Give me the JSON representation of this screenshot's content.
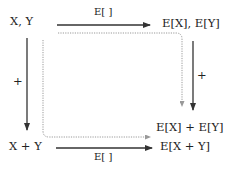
{
  "nodes": {
    "top_left": "X, Y",
    "top_right": "E[X], E[Y]",
    "mid_right": "E[X] + E[Y]",
    "bottom_left": "X + Y",
    "bottom_right": "E[X + Y]"
  },
  "edges": {
    "top_label": "E[ ]",
    "bottom_label": "E[ ]",
    "left_label": "+",
    "right_label": "+"
  },
  "colors": {
    "solid": "#333333",
    "dotted": "#999999"
  }
}
